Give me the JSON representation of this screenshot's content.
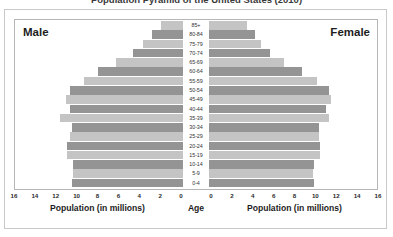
{
  "title": "Population Pyramid of the United States (2010)",
  "labels": {
    "male": "Male",
    "female": "Female",
    "age": "Age",
    "axis_left": "Population (in millions)",
    "axis_right": "Population (in millions)"
  },
  "colors": {
    "bar_dark": "#949494",
    "bar_light": "#c4c4c4",
    "outer_frame": "#c9c9c9",
    "plot_frame": "#b5b5b5",
    "background": "#ffffff",
    "text": "#1d1d1d"
  },
  "axis": {
    "left_ticks": [
      "16",
      "14",
      "12",
      "10",
      "8",
      "6",
      "4",
      "2",
      "0"
    ],
    "right_ticks": [
      "0",
      "2",
      "4",
      "6",
      "8",
      "10",
      "12",
      "14",
      "16"
    ],
    "max": 16,
    "grid": false
  },
  "chart_data": {
    "type": "bar",
    "subtype": "population-pyramid",
    "title": "Population Pyramid of the United States (2010)",
    "xlabel": "Population (in millions)",
    "ylabel": "Age",
    "xlim": [
      0,
      16
    ],
    "grid": false,
    "legend": [
      "Male",
      "Female"
    ],
    "legend_position": "inside-top-corners",
    "categories": [
      "85+",
      "80-84",
      "75-79",
      "70-74",
      "65-69",
      "60-64",
      "55-59",
      "50-54",
      "45-49",
      "40-44",
      "35-39",
      "30-34",
      "25-29",
      "20-24",
      "15-19",
      "10-14",
      "5-9",
      "0-4"
    ],
    "series": [
      {
        "name": "Male",
        "side": "left",
        "values": [
          2.1,
          3.0,
          3.8,
          4.8,
          6.4,
          8.1,
          9.5,
          10.8,
          11.2,
          10.8,
          11.8,
          10.6,
          10.8,
          11.1,
          11.1,
          10.5,
          10.5,
          10.6
        ]
      },
      {
        "name": "Female",
        "side": "right",
        "values": [
          3.6,
          4.4,
          5.0,
          5.8,
          7.2,
          8.9,
          10.3,
          11.5,
          11.7,
          11.2,
          11.5,
          10.5,
          10.5,
          10.6,
          10.6,
          10.1,
          10.0,
          10.1
        ]
      }
    ]
  }
}
